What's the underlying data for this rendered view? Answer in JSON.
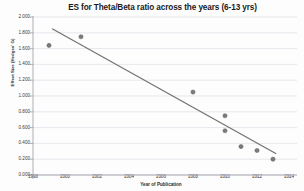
{
  "chart_data": {
    "type": "scatter",
    "title": "ES for Theta/Beta ratio across the years (6-13 yrs)",
    "xlabel": "Year of Publication",
    "ylabel": "Effect Size (Hedges' G)",
    "xlim": [
      1998,
      2014
    ],
    "ylim": [
      0.0,
      2.0
    ],
    "grid": true,
    "legend": "none",
    "xticks": [
      "1998",
      "2000",
      "2002",
      "2004",
      "2006",
      "2008",
      "2010",
      "2012",
      "2014"
    ],
    "yticks": [
      "0.000",
      "0.200",
      "0.400",
      "0.600",
      "0.800",
      "1.000",
      "1.200",
      "1.400",
      "1.600",
      "1.800",
      "2.000"
    ],
    "points": [
      {
        "x": 1999,
        "y": 1.64
      },
      {
        "x": 2001,
        "y": 1.75
      },
      {
        "x": 2008,
        "y": 1.05
      },
      {
        "x": 2010,
        "y": 0.75
      },
      {
        "x": 2010,
        "y": 0.56
      },
      {
        "x": 2011,
        "y": 0.36
      },
      {
        "x": 2012,
        "y": 0.31
      },
      {
        "x": 2013,
        "y": 0.2
      }
    ],
    "trendline": {
      "x_start": 1999.2,
      "y_start": 1.85,
      "x_end": 2013.2,
      "y_end": 0.27
    },
    "marker_color": "#7a7a7a",
    "trendline_color": "#6f6f6f",
    "grid_color": "#d8d8e2",
    "axis_color": "#9a9aa5"
  }
}
